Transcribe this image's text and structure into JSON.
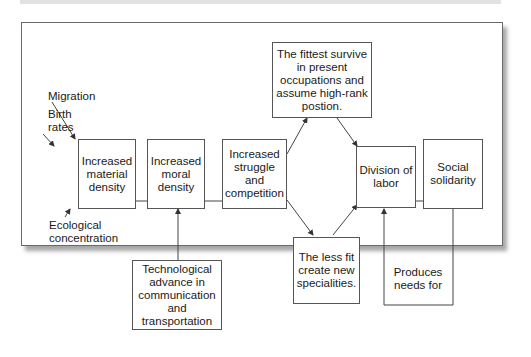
{
  "diagram": {
    "type": "flowchart",
    "nodes": {
      "material_density": "Increased material density",
      "moral_density": "Increased moral density",
      "struggle": "Increased struggle and competition",
      "fittest": "The fittest survive in present occupations and assume high-rank postion.",
      "less_fit": "The less fit create new specialities.",
      "division": "Division of labor",
      "solidarity": "Social solidarity",
      "technology": "Technological advance in communication and transportation",
      "produces": "Produces needs for"
    },
    "inputs": {
      "migration": "Migration",
      "birth_line1": "Birth",
      "birth_line2": "rates",
      "eco_line1": "Ecological",
      "eco_line2": "concentration"
    },
    "edges": [
      [
        "Migration",
        "Increased material density"
      ],
      [
        "Birth rates",
        "Increased material density"
      ],
      [
        "Ecological concentration",
        "Increased material density"
      ],
      [
        "Increased material density",
        "Increased moral density"
      ],
      [
        "Technological advance in communication and transportation",
        "Increased moral density"
      ],
      [
        "Increased moral density",
        "Increased struggle and competition"
      ],
      [
        "Increased struggle and competition",
        "The fittest survive in present occupations and assume high-rank postion."
      ],
      [
        "Increased struggle and competition",
        "The less fit create new specialities."
      ],
      [
        "The fittest survive in present occupations and assume high-rank postion.",
        "Division of labor"
      ],
      [
        "The less fit create new specialities.",
        "Division of labor"
      ],
      [
        "Division of labor",
        "Social solidarity"
      ],
      [
        "Social solidarity",
        "Division of labor (Produces needs for)"
      ]
    ]
  }
}
